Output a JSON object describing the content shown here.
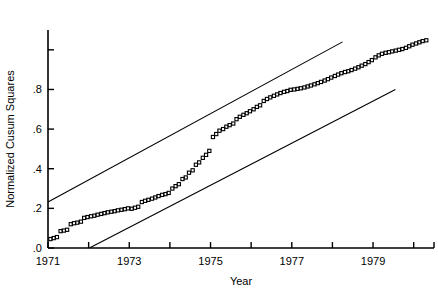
{
  "chart_data": {
    "type": "scatter",
    "title": "",
    "xlabel": "Year",
    "ylabel": "Normalized Cusum Squares",
    "xlim": [
      1971,
      1980.5
    ],
    "ylim": [
      0.0,
      1.1
    ],
    "grid": false,
    "legend": null,
    "x_ticks": [
      {
        "value": 1971,
        "label": "1971"
      },
      {
        "value": 1972,
        "label": ""
      },
      {
        "value": 1973,
        "label": "1973"
      },
      {
        "value": 1974,
        "label": ""
      },
      {
        "value": 1975,
        "label": "1975"
      },
      {
        "value": 1976,
        "label": ""
      },
      {
        "value": 1977,
        "label": "1977"
      },
      {
        "value": 1978,
        "label": ""
      },
      {
        "value": 1979,
        "label": "1979"
      },
      {
        "value": 1980,
        "label": ""
      },
      {
        "value": 1980.5,
        "label": ""
      }
    ],
    "y_ticks": [
      {
        "value": 0.0,
        "label": ".0"
      },
      {
        "value": 0.2,
        "label": ".2"
      },
      {
        "value": 0.4,
        "label": ".4"
      },
      {
        "value": 0.6,
        "label": ".6"
      },
      {
        "value": 0.8,
        "label": ".8"
      },
      {
        "value": 1.0,
        "label": ""
      }
    ],
    "series": [
      {
        "name": "Normalized cusum of squares",
        "marker": "open-square",
        "points": [
          [
            1971.06,
            0.045
          ],
          [
            1971.14,
            0.05
          ],
          [
            1971.22,
            0.055
          ],
          [
            1971.31,
            0.085
          ],
          [
            1971.39,
            0.088
          ],
          [
            1971.47,
            0.092
          ],
          [
            1971.56,
            0.12
          ],
          [
            1971.64,
            0.125
          ],
          [
            1971.72,
            0.128
          ],
          [
            1971.81,
            0.133
          ],
          [
            1971.89,
            0.152
          ],
          [
            1971.97,
            0.156
          ],
          [
            1972.06,
            0.16
          ],
          [
            1972.14,
            0.163
          ],
          [
            1972.22,
            0.168
          ],
          [
            1972.31,
            0.172
          ],
          [
            1972.39,
            0.176
          ],
          [
            1972.47,
            0.18
          ],
          [
            1972.56,
            0.183
          ],
          [
            1972.64,
            0.186
          ],
          [
            1972.72,
            0.19
          ],
          [
            1972.81,
            0.193
          ],
          [
            1972.89,
            0.196
          ],
          [
            1972.97,
            0.2
          ],
          [
            1973.06,
            0.198
          ],
          [
            1973.14,
            0.203
          ],
          [
            1973.22,
            0.208
          ],
          [
            1973.31,
            0.232
          ],
          [
            1973.39,
            0.238
          ],
          [
            1973.47,
            0.243
          ],
          [
            1973.56,
            0.249
          ],
          [
            1973.64,
            0.255
          ],
          [
            1973.72,
            0.262
          ],
          [
            1973.81,
            0.268
          ],
          [
            1973.89,
            0.272
          ],
          [
            1973.97,
            0.278
          ],
          [
            1974.06,
            0.3
          ],
          [
            1974.14,
            0.312
          ],
          [
            1974.22,
            0.322
          ],
          [
            1974.31,
            0.348
          ],
          [
            1974.39,
            0.356
          ],
          [
            1974.47,
            0.38
          ],
          [
            1974.56,
            0.392
          ],
          [
            1974.64,
            0.42
          ],
          [
            1974.72,
            0.432
          ],
          [
            1974.81,
            0.455
          ],
          [
            1974.89,
            0.47
          ],
          [
            1974.97,
            0.49
          ],
          [
            1975.06,
            0.56
          ],
          [
            1975.14,
            0.575
          ],
          [
            1975.22,
            0.592
          ],
          [
            1975.31,
            0.6
          ],
          [
            1975.39,
            0.612
          ],
          [
            1975.47,
            0.62
          ],
          [
            1975.56,
            0.628
          ],
          [
            1975.64,
            0.65
          ],
          [
            1975.72,
            0.662
          ],
          [
            1975.81,
            0.672
          ],
          [
            1975.89,
            0.68
          ],
          [
            1975.97,
            0.69
          ],
          [
            1976.06,
            0.7
          ],
          [
            1976.14,
            0.712
          ],
          [
            1976.22,
            0.72
          ],
          [
            1976.31,
            0.742
          ],
          [
            1976.39,
            0.752
          ],
          [
            1976.47,
            0.76
          ],
          [
            1976.56,
            0.768
          ],
          [
            1976.64,
            0.775
          ],
          [
            1976.72,
            0.782
          ],
          [
            1976.81,
            0.788
          ],
          [
            1976.89,
            0.792
          ],
          [
            1976.97,
            0.798
          ],
          [
            1977.06,
            0.8
          ],
          [
            1977.14,
            0.803
          ],
          [
            1977.22,
            0.806
          ],
          [
            1977.31,
            0.81
          ],
          [
            1977.39,
            0.815
          ],
          [
            1977.47,
            0.82
          ],
          [
            1977.56,
            0.826
          ],
          [
            1977.64,
            0.832
          ],
          [
            1977.72,
            0.838
          ],
          [
            1977.81,
            0.845
          ],
          [
            1977.89,
            0.852
          ],
          [
            1977.97,
            0.86
          ],
          [
            1978.06,
            0.868
          ],
          [
            1978.14,
            0.875
          ],
          [
            1978.22,
            0.882
          ],
          [
            1978.31,
            0.888
          ],
          [
            1978.39,
            0.892
          ],
          [
            1978.47,
            0.898
          ],
          [
            1978.56,
            0.905
          ],
          [
            1978.64,
            0.912
          ],
          [
            1978.72,
            0.92
          ],
          [
            1978.81,
            0.928
          ],
          [
            1978.89,
            0.938
          ],
          [
            1978.97,
            0.948
          ],
          [
            1979.06,
            0.962
          ],
          [
            1979.14,
            0.972
          ],
          [
            1979.22,
            0.98
          ],
          [
            1979.31,
            0.985
          ],
          [
            1979.39,
            0.988
          ],
          [
            1979.47,
            0.992
          ],
          [
            1979.56,
            0.996
          ],
          [
            1979.64,
            1.0
          ],
          [
            1979.72,
            1.004
          ],
          [
            1979.81,
            1.01
          ],
          [
            1979.89,
            1.018
          ],
          [
            1979.97,
            1.026
          ],
          [
            1980.06,
            1.032
          ],
          [
            1980.14,
            1.038
          ],
          [
            1980.22,
            1.044
          ],
          [
            1980.31,
            1.048
          ]
        ]
      }
    ],
    "reference_lines": [
      {
        "name": "upper-confidence-bound",
        "from": [
          1971.0,
          0.232
        ],
        "to": [
          1978.25,
          1.04
        ]
      },
      {
        "name": "lower-confidence-bound",
        "from": [
          1972.02,
          0.0
        ],
        "to": [
          1979.55,
          0.8
        ]
      }
    ]
  }
}
